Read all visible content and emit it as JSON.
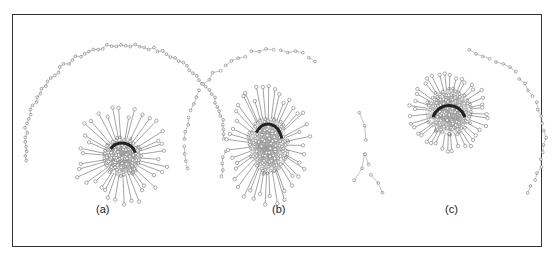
{
  "figure": {
    "panels": [
      {
        "id": "a",
        "label": "(a)",
        "cx": 122,
        "cy": 157,
        "core_r": 20,
        "spokes": 38,
        "spoke_len": 26,
        "shape": "round"
      },
      {
        "id": "b",
        "label": "(b)",
        "cx": 268,
        "cy": 145,
        "core_r": 26,
        "spokes": 44,
        "spoke_len": 24,
        "shape": "oval"
      },
      {
        "id": "c",
        "label": "(c)",
        "cx": 449,
        "cy": 112,
        "core_r": 24,
        "spokes": 40,
        "spoke_len": 14,
        "shape": "ring"
      }
    ],
    "label_positions": [
      {
        "label": "(a)",
        "x": 96,
        "y": 209
      },
      {
        "label": "(b)",
        "x": 272,
        "y": 209
      },
      {
        "label": "(c)",
        "x": 445,
        "y": 209
      }
    ],
    "colors": {
      "border": "#333333",
      "node_fill": "#ffffff",
      "node_stroke": "#777777",
      "edge": "#888888",
      "core_dark": "#222222"
    }
  }
}
